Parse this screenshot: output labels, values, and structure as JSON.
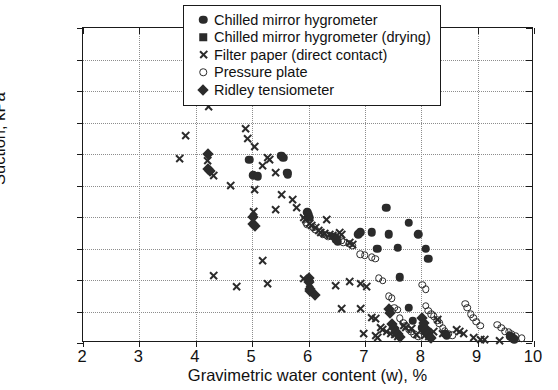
{
  "chart_data": {
    "type": "scatter",
    "title": "",
    "xlabel": "Gravimetric water content (w), %",
    "ylabel": "Suction, kPa",
    "xlim": [
      2,
      10
    ],
    "ylim": [
      0,
      1000
    ],
    "xticks": [
      2,
      3,
      4,
      5,
      6,
      7,
      8,
      9,
      10
    ],
    "yticks": [
      0,
      100,
      200,
      300,
      400,
      500,
      600,
      700,
      800,
      900,
      1000
    ],
    "grid": true,
    "legend_position": "top-right",
    "series": [
      {
        "name": "Chilled mirror hygrometer",
        "marker": "filled-circle",
        "color": "#2b2b2b",
        "points": [
          [
            4.22,
            810
          ],
          [
            4.52,
            822
          ],
          [
            4.95,
            582
          ],
          [
            5.02,
            532
          ],
          [
            5.1,
            530
          ],
          [
            5.52,
            595
          ],
          [
            5.55,
            588
          ],
          [
            5.62,
            540
          ],
          [
            5.63,
            536
          ],
          [
            5.98,
            415
          ],
          [
            6.0,
            405
          ],
          [
            6.02,
            398
          ],
          [
            6.45,
            338
          ],
          [
            6.48,
            330
          ],
          [
            6.52,
            322
          ],
          [
            6.88,
            345
          ],
          [
            6.92,
            352
          ],
          [
            7.12,
            352
          ],
          [
            7.22,
            300
          ],
          [
            7.38,
            430
          ],
          [
            7.42,
            345
          ],
          [
            7.58,
            302
          ],
          [
            7.78,
            382
          ],
          [
            7.95,
            345
          ],
          [
            8.08,
            300
          ],
          [
            8.12,
            268
          ],
          [
            7.62,
            208
          ],
          [
            7.78,
            112
          ],
          [
            7.85,
            70
          ],
          [
            8.02,
            48
          ],
          [
            8.05,
            42
          ],
          [
            8.42,
            30
          ],
          [
            8.45,
            25
          ],
          [
            9.58,
            22
          ],
          [
            9.62,
            15
          ],
          [
            9.65,
            12
          ]
        ]
      },
      {
        "name": "Chilled mirror hygrometer (drying)",
        "marker": "filled-square",
        "color": "#2b2b2b",
        "points": []
      },
      {
        "name": "Filter paper (direct contact)",
        "marker": "cross",
        "color": "#2b2b2b",
        "points": [
          [
            4.38,
            930
          ],
          [
            4.45,
            825
          ],
          [
            4.32,
            785
          ],
          [
            4.22,
            750
          ],
          [
            4.72,
            800
          ],
          [
            4.88,
            682
          ],
          [
            4.92,
            650
          ],
          [
            5.05,
            625
          ],
          [
            3.82,
            658
          ],
          [
            3.72,
            585
          ],
          [
            4.2,
            578
          ],
          [
            5.28,
            588
          ],
          [
            5.3,
            582
          ],
          [
            4.32,
            532
          ],
          [
            5.18,
            562
          ],
          [
            5.42,
            540
          ],
          [
            4.62,
            500
          ],
          [
            5.05,
            488
          ],
          [
            5.52,
            470
          ],
          [
            5.72,
            455
          ],
          [
            5.42,
            425
          ],
          [
            5.02,
            418
          ],
          [
            5.92,
            400
          ],
          [
            5.95,
            392
          ],
          [
            6.02,
            378
          ],
          [
            6.05,
            372
          ],
          [
            6.12,
            368
          ],
          [
            6.18,
            358
          ],
          [
            6.22,
            352
          ],
          [
            6.28,
            348
          ],
          [
            6.38,
            345
          ],
          [
            6.42,
            340
          ],
          [
            6.55,
            352
          ],
          [
            6.58,
            345
          ],
          [
            6.72,
            318
          ],
          [
            6.78,
            312
          ],
          [
            5.78,
            430
          ],
          [
            6.32,
            392
          ],
          [
            4.32,
            215
          ],
          [
            4.72,
            178
          ],
          [
            5.18,
            262
          ],
          [
            5.28,
            190
          ],
          [
            5.92,
            205
          ],
          [
            6.02,
            190
          ],
          [
            6.48,
            182
          ],
          [
            6.72,
            195
          ],
          [
            6.92,
            188
          ],
          [
            7.02,
            178
          ],
          [
            6.58,
            110
          ],
          [
            6.92,
            108
          ],
          [
            7.12,
            82
          ],
          [
            7.18,
            78
          ],
          [
            7.28,
            48
          ],
          [
            7.32,
            42
          ],
          [
            7.38,
            38
          ],
          [
            7.45,
            30
          ],
          [
            7.52,
            28
          ],
          [
            7.58,
            22
          ],
          [
            7.68,
            55
          ],
          [
            7.72,
            50
          ],
          [
            7.82,
            45
          ],
          [
            7.92,
            28
          ],
          [
            8.05,
            25
          ],
          [
            8.12,
            20
          ],
          [
            8.22,
            38
          ],
          [
            8.28,
            75
          ],
          [
            8.62,
            42
          ],
          [
            8.68,
            35
          ],
          [
            8.75,
            30
          ],
          [
            8.92,
            18
          ],
          [
            9.05,
            12
          ],
          [
            9.12,
            10
          ],
          [
            9.38,
            8
          ],
          [
            8.38,
            30
          ],
          [
            7.18,
            25
          ],
          [
            7.22,
            18
          ],
          [
            6.98,
            30
          ]
        ]
      },
      {
        "name": "Pressure plate",
        "marker": "open-circle",
        "color": "#2b2b2b",
        "points": [
          [
            5.95,
            382
          ],
          [
            5.98,
            375
          ],
          [
            6.08,
            368
          ],
          [
            6.12,
            360
          ],
          [
            6.22,
            352
          ],
          [
            6.25,
            345
          ],
          [
            6.32,
            342
          ],
          [
            6.35,
            338
          ],
          [
            6.48,
            335
          ],
          [
            6.52,
            330
          ],
          [
            6.58,
            325
          ],
          [
            6.62,
            320
          ],
          [
            6.72,
            315
          ],
          [
            6.78,
            308
          ],
          [
            6.92,
            282
          ],
          [
            7.0,
            278
          ],
          [
            7.12,
            272
          ],
          [
            7.18,
            268
          ],
          [
            7.25,
            205
          ],
          [
            7.32,
            198
          ],
          [
            7.42,
            148
          ],
          [
            7.48,
            142
          ],
          [
            7.52,
            112
          ],
          [
            7.58,
            105
          ],
          [
            7.62,
            78
          ],
          [
            7.68,
            65
          ],
          [
            7.72,
            55
          ],
          [
            7.78,
            42
          ],
          [
            7.82,
            35
          ],
          [
            7.88,
            28
          ],
          [
            7.95,
            22
          ],
          [
            8.08,
            118
          ],
          [
            8.12,
            102
          ],
          [
            8.18,
            92
          ],
          [
            8.22,
            85
          ],
          [
            8.28,
            72
          ],
          [
            8.32,
            62
          ],
          [
            8.38,
            48
          ],
          [
            8.42,
            38
          ],
          [
            8.48,
            30
          ],
          [
            8.55,
            25
          ],
          [
            8.78,
            125
          ],
          [
            8.82,
            112
          ],
          [
            8.88,
            92
          ],
          [
            8.92,
            80
          ],
          [
            8.98,
            68
          ],
          [
            9.05,
            55
          ],
          [
            9.35,
            58
          ],
          [
            9.42,
            48
          ],
          [
            9.48,
            38
          ],
          [
            9.55,
            35
          ],
          [
            9.6,
            28
          ],
          [
            9.68,
            22
          ],
          [
            9.78,
            15
          ],
          [
            8.02,
            185
          ],
          [
            8.08,
            170
          ]
        ]
      },
      {
        "name": "Ridley tensiometer",
        "marker": "filled-diamond",
        "color": "#2b2b2b",
        "points": [
          [
            4.5,
            812
          ],
          [
            4.48,
            805
          ],
          [
            4.22,
            600
          ],
          [
            4.22,
            552
          ],
          [
            4.25,
            545
          ],
          [
            5.02,
            400
          ],
          [
            5.02,
            378
          ],
          [
            5.05,
            372
          ],
          [
            6.0,
            205
          ],
          [
            6.0,
            195
          ],
          [
            6.02,
            172
          ],
          [
            6.02,
            165
          ],
          [
            7.42,
            108
          ],
          [
            7.45,
            95
          ],
          [
            7.48,
            60
          ],
          [
            7.52,
            48
          ],
          [
            7.55,
            35
          ],
          [
            7.58,
            28
          ],
          [
            7.62,
            20
          ],
          [
            8.02,
            78
          ],
          [
            8.05,
            62
          ],
          [
            8.08,
            45
          ],
          [
            8.1,
            35
          ],
          [
            8.12,
            28
          ],
          [
            8.15,
            20
          ],
          [
            8.18,
            15
          ],
          [
            6.12,
            152
          ]
        ]
      }
    ]
  },
  "legend": {
    "items": [
      {
        "label": "Chilled mirror hygrometer",
        "marker": "filled-circle"
      },
      {
        "label": "Chilled mirror hygrometer (drying)",
        "marker": "filled-square"
      },
      {
        "label": "Filter paper (direct contact)",
        "marker": "cross"
      },
      {
        "label": "Pressure plate",
        "marker": "open-circle"
      },
      {
        "label": "Ridley tensiometer",
        "marker": "filled-diamond"
      }
    ]
  }
}
